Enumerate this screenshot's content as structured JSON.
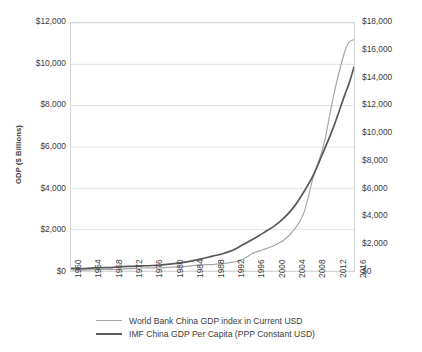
{
  "chart_data": {
    "type": "line",
    "title": "",
    "subtitle": "",
    "xlabel": "",
    "ylabel": "GDP ($ Billions)",
    "ylabel_right": "$ GDP Per Capita (PPP Constant USD)",
    "grid": true,
    "legend_position": "bottom",
    "xlim": [
      1960,
      2016
    ],
    "ylim": [
      0,
      12000
    ],
    "ylim_right": [
      0,
      18000
    ],
    "x_tick_labels": [
      "1960",
      "1964",
      "1968",
      "1972",
      "1976",
      "1980",
      "1984",
      "1988",
      "1992",
      "1996",
      "2000",
      "2004",
      "2008",
      "2012",
      "2016"
    ],
    "y_tick_labels_left": [
      "$0",
      "$2,000",
      "$4,000",
      "$6,000",
      "$8,000",
      "$10,000",
      "$12,000"
    ],
    "y_tick_values_left": [
      0,
      2000,
      4000,
      6000,
      8000,
      10000,
      12000
    ],
    "y_tick_labels_right": [
      "$0",
      "$2,000",
      "$4,000",
      "$6,000",
      "$8,000",
      "$10,000",
      "$12,000",
      "$14,000",
      "$16,000",
      "$18,000"
    ],
    "y_tick_values_right": [
      0,
      2000,
      4000,
      6000,
      8000,
      10000,
      12000,
      14000,
      16000,
      18000
    ],
    "x": [
      1960,
      1962,
      1964,
      1966,
      1968,
      1970,
      1972,
      1974,
      1976,
      1978,
      1980,
      1982,
      1984,
      1986,
      1988,
      1990,
      1992,
      1994,
      1996,
      1998,
      2000,
      2002,
      2004,
      2006,
      2008,
      2010,
      2012,
      2014,
      2015,
      2016
    ],
    "series": [
      {
        "name": "World Bank China GDP index in Current USD",
        "axis": "left",
        "color": "#a6a6a6",
        "values": [
          60,
          47,
          60,
          76,
          70,
          92,
          113,
          144,
          153,
          150,
          191,
          205,
          259,
          300,
          312,
          361,
          427,
          564,
          864,
          1029,
          1211,
          1471,
          1955,
          2752,
          4594,
          6087,
          8532,
          10476,
          11062,
          11191
        ]
      },
      {
        "name": "IMF China GDP Per Capita (PPP Constant USD)",
        "axis": "right",
        "color": "#595959",
        "values": [
          200,
          170,
          210,
          250,
          250,
          310,
          340,
          370,
          400,
          450,
          520,
          610,
          740,
          900,
          1080,
          1250,
          1500,
          1900,
          2300,
          2750,
          3200,
          3800,
          4600,
          5700,
          7000,
          8700,
          10500,
          12600,
          13600,
          14800
        ]
      }
    ]
  },
  "legend": {
    "items": [
      {
        "label": "World Bank China GDP index in Current USD",
        "color": "#a6a6a6",
        "width": 1.4
      },
      {
        "label": "IMF China GDP Per Capita (PPP Constant USD)",
        "color": "#595959",
        "width": 2.2
      }
    ]
  }
}
